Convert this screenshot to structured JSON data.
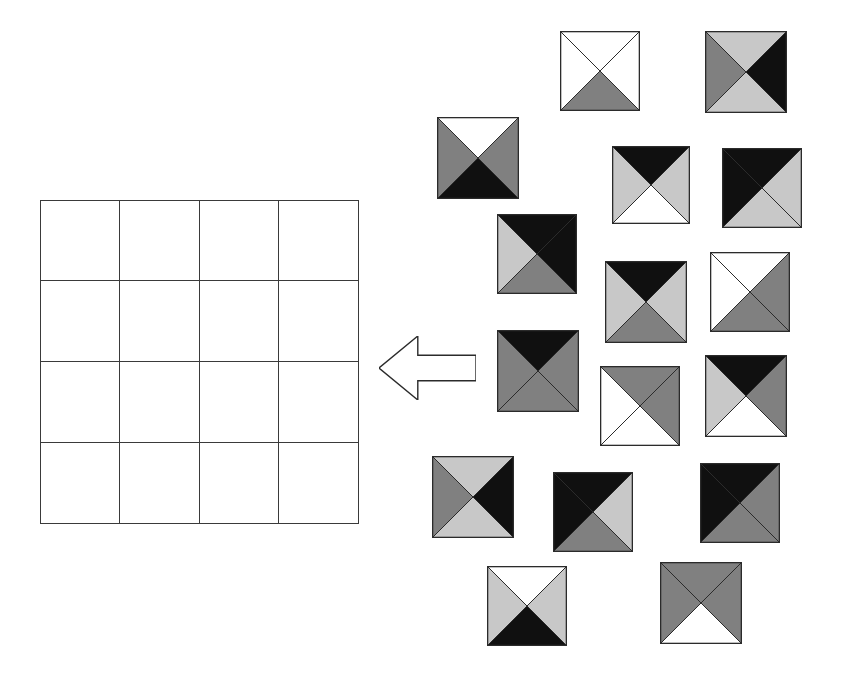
{
  "figure": {
    "kind": "visual-reasoning-matrix-task",
    "background_color": "#ffffff",
    "outline_color": "#2b2b2b",
    "palette": {
      "white": "#ffffff",
      "light_gray": "#c8c8c8",
      "medium_gray": "#808080",
      "black": "#101010"
    }
  },
  "answer_grid": {
    "name": "empty 4x4 grid",
    "rows": 4,
    "cols": 4,
    "x": 40,
    "y": 200,
    "width": 319,
    "height": 324,
    "line_color": "#3a3a3a",
    "cells": [
      [
        "",
        "",
        "",
        ""
      ],
      [
        "",
        "",
        "",
        ""
      ],
      [
        "",
        "",
        "",
        ""
      ],
      [
        "",
        "",
        "",
        ""
      ]
    ]
  },
  "arrow": {
    "name": "left-pointing-block-arrow",
    "direction": "left",
    "x": 379,
    "y": 336,
    "width": 97,
    "height": 64,
    "fill": "#ffffff",
    "stroke": "#2b2b2b"
  },
  "tiles": [
    {
      "id": 1,
      "x": 560,
      "y": 31,
      "size": 80,
      "top": "white",
      "right": "white",
      "bottom": "medium_gray",
      "left": "white"
    },
    {
      "id": 2,
      "x": 705,
      "y": 31,
      "size": 82,
      "top": "light_gray",
      "right": "black",
      "bottom": "light_gray",
      "left": "medium_gray"
    },
    {
      "id": 3,
      "x": 437,
      "y": 117,
      "size": 82,
      "top": "white",
      "right": "medium_gray",
      "bottom": "black",
      "left": "medium_gray"
    },
    {
      "id": 4,
      "x": 612,
      "y": 146,
      "size": 78,
      "top": "black",
      "right": "light_gray",
      "bottom": "white",
      "left": "light_gray"
    },
    {
      "id": 5,
      "x": 722,
      "y": 148,
      "size": 80,
      "top": "black",
      "right": "light_gray",
      "bottom": "light_gray",
      "left": "black"
    },
    {
      "id": 6,
      "x": 497,
      "y": 214,
      "size": 80,
      "top": "black",
      "right": "black",
      "bottom": "medium_gray",
      "left": "light_gray"
    },
    {
      "id": 7,
      "x": 605,
      "y": 261,
      "size": 82,
      "top": "black",
      "right": "light_gray",
      "bottom": "medium_gray",
      "left": "light_gray"
    },
    {
      "id": 8,
      "x": 710,
      "y": 252,
      "size": 80,
      "top": "white",
      "right": "medium_gray",
      "bottom": "medium_gray",
      "left": "white"
    },
    {
      "id": 9,
      "x": 497,
      "y": 330,
      "size": 82,
      "top": "black",
      "right": "medium_gray",
      "bottom": "medium_gray",
      "left": "medium_gray"
    },
    {
      "id": 10,
      "x": 600,
      "y": 366,
      "size": 80,
      "top": "medium_gray",
      "right": "medium_gray",
      "bottom": "white",
      "left": "white"
    },
    {
      "id": 11,
      "x": 705,
      "y": 355,
      "size": 82,
      "top": "black",
      "right": "medium_gray",
      "bottom": "white",
      "left": "light_gray"
    },
    {
      "id": 12,
      "x": 432,
      "y": 456,
      "size": 82,
      "top": "light_gray",
      "right": "black",
      "bottom": "light_gray",
      "left": "medium_gray"
    },
    {
      "id": 13,
      "x": 553,
      "y": 472,
      "size": 80,
      "top": "black",
      "right": "light_gray",
      "bottom": "medium_gray",
      "left": "black"
    },
    {
      "id": 14,
      "x": 700,
      "y": 463,
      "size": 80,
      "top": "black",
      "right": "medium_gray",
      "bottom": "medium_gray",
      "left": "black"
    },
    {
      "id": 15,
      "x": 487,
      "y": 566,
      "size": 80,
      "top": "white",
      "right": "light_gray",
      "bottom": "black",
      "left": "light_gray"
    },
    {
      "id": 16,
      "x": 660,
      "y": 562,
      "size": 82,
      "top": "medium_gray",
      "right": "medium_gray",
      "bottom": "white",
      "left": "medium_gray"
    }
  ]
}
